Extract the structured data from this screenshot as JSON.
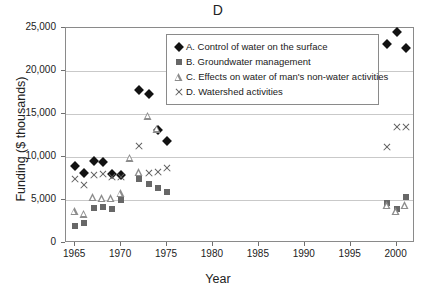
{
  "chart_data": {
    "type": "scatter",
    "title": "D",
    "xlabel": "Year",
    "ylabel": "Funding ($ thousands)",
    "xlim": [
      1964,
      2002
    ],
    "ylim": [
      0,
      25000
    ],
    "xticks": [
      1965,
      1970,
      1975,
      1980,
      1985,
      1990,
      1995,
      2000
    ],
    "yticks": [
      0,
      5000,
      10000,
      15000,
      20000,
      25000
    ],
    "ytick_labels": [
      "0",
      "5,000",
      "10,000",
      "15,000",
      "20,000",
      "25,000"
    ],
    "grid": "horizontal",
    "legend_position": "top-center-inside",
    "series": [
      {
        "name": "A. Control of water on the surface",
        "key": "A",
        "marker": "diamond",
        "color": "#121212",
        "points": [
          {
            "x": 1965,
            "y": 8900
          },
          {
            "x": 1966,
            "y": 8100
          },
          {
            "x": 1967,
            "y": 9500
          },
          {
            "x": 1968,
            "y": 9400
          },
          {
            "x": 1969,
            "y": 8000
          },
          {
            "x": 1970,
            "y": 7900
          },
          {
            "x": 1972,
            "y": 17800
          },
          {
            "x": 1973,
            "y": 17300
          },
          {
            "x": 1974,
            "y": 13100
          },
          {
            "x": 1975,
            "y": 11900
          },
          {
            "x": 1999,
            "y": 23100
          },
          {
            "x": 2000,
            "y": 24500
          },
          {
            "x": 2001,
            "y": 22700
          }
        ]
      },
      {
        "name": "B. Groundwater management",
        "key": "B",
        "marker": "square",
        "color": "#676767",
        "points": [
          {
            "x": 1965,
            "y": 2000
          },
          {
            "x": 1966,
            "y": 2300
          },
          {
            "x": 1967,
            "y": 4100
          },
          {
            "x": 1968,
            "y": 4200
          },
          {
            "x": 1969,
            "y": 4000
          },
          {
            "x": 1970,
            "y": 5000
          },
          {
            "x": 1972,
            "y": 7400
          },
          {
            "x": 1973,
            "y": 6900
          },
          {
            "x": 1974,
            "y": 6400
          },
          {
            "x": 1975,
            "y": 5900
          },
          {
            "x": 1999,
            "y": 4700
          },
          {
            "x": 2000,
            "y": 3900
          },
          {
            "x": 2001,
            "y": 5400
          }
        ]
      },
      {
        "name": "C. Effects on water of man's non-water activities",
        "key": "C",
        "marker": "triangle",
        "color": "#8c8c8c",
        "points": [
          {
            "x": 1965,
            "y": 3700
          },
          {
            "x": 1966,
            "y": 3400
          },
          {
            "x": 1967,
            "y": 5300
          },
          {
            "x": 1968,
            "y": 5200
          },
          {
            "x": 1969,
            "y": 5200
          },
          {
            "x": 1970,
            "y": 5800
          },
          {
            "x": 1971,
            "y": 9900
          },
          {
            "x": 1972,
            "y": 8200
          },
          {
            "x": 1973,
            "y": 14800
          },
          {
            "x": 1974,
            "y": 13300
          },
          {
            "x": 1999,
            "y": 4400
          },
          {
            "x": 2000,
            "y": 3700
          },
          {
            "x": 2001,
            "y": 4400
          }
        ]
      },
      {
        "name": "D. Watershed activities",
        "key": "D",
        "marker": "cross",
        "color": "#5e5e5e",
        "points": [
          {
            "x": 1965,
            "y": 7400
          },
          {
            "x": 1966,
            "y": 6700
          },
          {
            "x": 1967,
            "y": 7900
          },
          {
            "x": 1968,
            "y": 8000
          },
          {
            "x": 1969,
            "y": 7700
          },
          {
            "x": 1970,
            "y": 7700
          },
          {
            "x": 1972,
            "y": 11300
          },
          {
            "x": 1973,
            "y": 8100
          },
          {
            "x": 1974,
            "y": 8300
          },
          {
            "x": 1975,
            "y": 8700
          },
          {
            "x": 1999,
            "y": 11200
          },
          {
            "x": 2000,
            "y": 13500
          },
          {
            "x": 2001,
            "y": 13500
          }
        ]
      }
    ]
  }
}
